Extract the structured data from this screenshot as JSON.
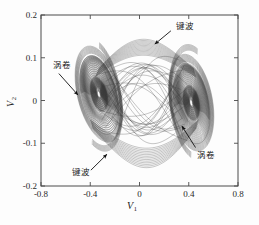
{
  "chart_data": {
    "type": "line",
    "title": "",
    "subtitle": "",
    "xlabel": "V",
    "xlabel_sub": "1",
    "ylabel": "V",
    "ylabel_sub": "2",
    "xlim": [
      -0.8,
      0.8
    ],
    "ylim": [
      -0.2,
      0.2
    ],
    "xticks": [
      "-0.8",
      "-0.4",
      "0",
      "0.4",
      "0.8"
    ],
    "xtick_values": [
      -0.8,
      -0.4,
      0,
      0.4,
      0.8
    ],
    "yticks": [
      "0.2",
      "0.1",
      "0",
      "-0.1",
      "-0.2"
    ],
    "ytick_values": [
      0.2,
      0.1,
      0,
      -0.1,
      -0.2
    ],
    "grid": false,
    "legend": "none",
    "series_name": "double-scroll chaotic attractor",
    "series_color": "#3a3a3a",
    "line_width": 0.35,
    "attractor": {
      "left_scroll_center": [
        -0.33,
        0.015
      ],
      "right_scroll_center": [
        0.42,
        -0.005
      ],
      "left_scroll_radius_x": 0.17,
      "left_scroll_radius_y": 0.085,
      "right_scroll_radius_x": 0.16,
      "right_scroll_radius_y": 0.09,
      "x_extent": [
        -0.54,
        0.62
      ],
      "y_extent": [
        -0.165,
        0.155
      ],
      "spiral_turns": 16,
      "connecting_bands": 14
    },
    "annotations": [
      {
        "id": "key-wave-top",
        "text": "键波",
        "text_xy": [
          0.3,
          0.175
        ],
        "arrow_from": [
          0.255,
          0.163
        ],
        "arrow_to": [
          0.125,
          0.132
        ]
      },
      {
        "id": "scroll-left",
        "text": "涡卷",
        "text_xy": [
          -0.7,
          0.082
        ],
        "arrow_from": [
          -0.655,
          0.063
        ],
        "arrow_to": [
          -0.5,
          0.013
        ]
      },
      {
        "id": "scroll-right",
        "text": "涡卷",
        "text_xy": [
          0.47,
          -0.128
        ],
        "arrow_from": [
          0.455,
          -0.11
        ],
        "arrow_to": [
          0.345,
          -0.06
        ]
      },
      {
        "id": "key-wave-bottom",
        "text": "键波",
        "text_xy": [
          -0.545,
          -0.168
        ],
        "arrow_from": [
          -0.395,
          -0.163
        ],
        "arrow_to": [
          -0.265,
          -0.126
        ]
      }
    ]
  },
  "figure": {
    "background_color": "#fdfdfd",
    "frame_color": "#4a4a4a",
    "axis_text_color": "#2a2a2a"
  }
}
